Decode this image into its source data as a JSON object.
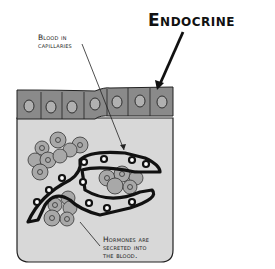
{
  "title": "Endocrine",
  "labels": {
    "blood_line1": "Blood in",
    "blood_line2": "capillaries",
    "hormone_line1": "Hormones are",
    "hormone_line2": "secreted into",
    "hormone_line3": "the blood."
  },
  "colors": {
    "epithelium": "#8a8a8a",
    "nucleus": "#b0b0b0",
    "tissue": "#d8d8d8",
    "cluster_cell": "#a8a8a8",
    "outline": "#1a1a1a"
  }
}
